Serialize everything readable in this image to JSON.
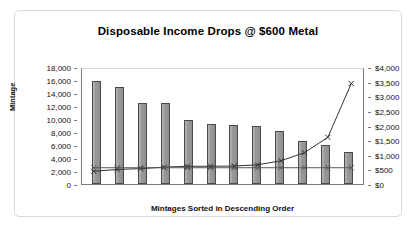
{
  "chart_data": {
    "type": "bar",
    "title": "Disposable Income Drops @ $600 Metal",
    "xlabel": "Mintages Sorted in Descending Order",
    "ylabel": "Mintage",
    "y2label": "Price of Coin or Bullion",
    "grid": false,
    "legend": "none",
    "categories": [
      "1",
      "2",
      "3",
      "4",
      "5",
      "6",
      "7",
      "8",
      "9",
      "10",
      "11",
      "12"
    ],
    "ylim": [
      0,
      18000
    ],
    "y2lim": [
      0,
      4000
    ],
    "yticks": [
      "0",
      "2,000",
      "4,000",
      "6,000",
      "8,000",
      "10,000",
      "12,000",
      "14,000",
      "16,000",
      "18,000"
    ],
    "y2ticks": [
      "$0",
      "$500",
      "$1,000",
      "$1,500",
      "$2,000",
      "$2,500",
      "$3,000",
      "$3,500",
      "$4,000"
    ],
    "series": [
      {
        "name": "Mintage",
        "type": "bar",
        "axis": "left",
        "color": "#999999",
        "values": [
          15900,
          14900,
          12500,
          12400,
          9800,
          9200,
          9100,
          8900,
          8200,
          6600,
          6000,
          4900
        ]
      },
      {
        "name": "Price of Coin",
        "type": "line",
        "axis": "right",
        "marker": "x",
        "color": "#333333",
        "values": [
          480,
          540,
          570,
          620,
          650,
          650,
          660,
          700,
          840,
          1120,
          1650,
          3500
        ]
      },
      {
        "name": "Bullion",
        "type": "line",
        "axis": "right",
        "marker": "x",
        "color": "#555555",
        "values": [
          600,
          600,
          600,
          600,
          600,
          600,
          600,
          600,
          600,
          600,
          600,
          600
        ]
      }
    ]
  }
}
